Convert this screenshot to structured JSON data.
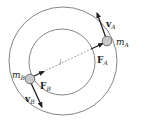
{
  "diagram": {
    "type": "two masses on concentric circular orbits",
    "colors": {
      "line": "#555555",
      "mass_fill": "#c8c8c8",
      "arrow": "#222222"
    },
    "labels": {
      "mA": {
        "main": "m",
        "sub": "A"
      },
      "mB": {
        "main": "m",
        "sub": "B"
      },
      "vA": {
        "main": "v",
        "sub": "A"
      },
      "vB": {
        "main": "v",
        "sub": "B"
      },
      "FA": {
        "main": "F",
        "sub": "A"
      },
      "FB": {
        "main": "F",
        "sub": "B"
      }
    }
  }
}
